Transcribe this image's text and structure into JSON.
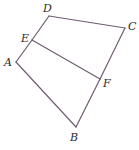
{
  "diagram": {
    "type": "geometry",
    "line_color": "#6e5d6e",
    "points": {
      "A": {
        "x": 16,
        "y": 62,
        "label": "A",
        "lx": 4,
        "ly": 66
      },
      "B": {
        "x": 76,
        "y": 127,
        "label": "B",
        "lx": 70,
        "ly": 141
      },
      "C": {
        "x": 125,
        "y": 28,
        "label": "C",
        "lx": 128,
        "ly": 30
      },
      "D": {
        "x": 49,
        "y": 16,
        "label": "D",
        "lx": 43,
        "ly": 12
      },
      "E": {
        "x": 32,
        "y": 40,
        "label": "E",
        "lx": 21,
        "ly": 42
      },
      "F": {
        "x": 100,
        "y": 79,
        "label": "F",
        "lx": 103,
        "ly": 87
      }
    },
    "segments": [
      {
        "from": "A",
        "to": "E"
      },
      {
        "from": "E",
        "to": "D"
      },
      {
        "from": "D",
        "to": "C"
      },
      {
        "from": "C",
        "to": "F"
      },
      {
        "from": "F",
        "to": "B"
      },
      {
        "from": "B",
        "to": "A"
      },
      {
        "from": "E",
        "to": "F"
      }
    ],
    "labels": {
      "A": "A",
      "B": "B",
      "C": "C",
      "D": "D",
      "E": "E",
      "F": "F"
    }
  }
}
